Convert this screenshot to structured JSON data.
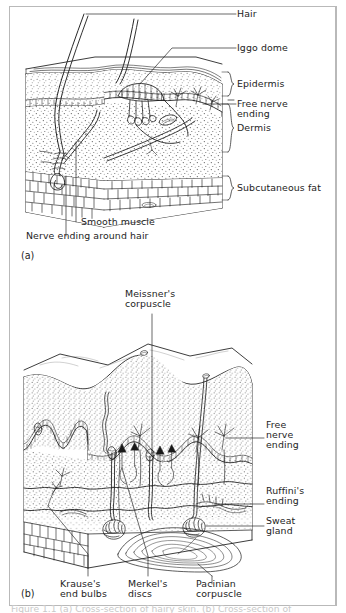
{
  "figure": {
    "caption": "Figure 1.1 (a) Cross-section of hairy skin. (b) Cross-section of",
    "panels": [
      {
        "id": "(a)",
        "title": "hairy skin cross-section"
      },
      {
        "id": "(b)",
        "title": "glabrous skin cross-section"
      }
    ]
  },
  "panel_a": {
    "id": "(a)",
    "labels": {
      "hair": "Hair",
      "iggo_dome": "Iggo dome",
      "epidermis": "Epidermis",
      "free_nerve_ending_l1": "Free nerve",
      "free_nerve_ending_l2": "ending",
      "dermis": "Dermis",
      "subcutaneous_fat": "Subcutaneous fat",
      "smooth_muscle": "Smooth muscle",
      "nerve_ending_around_hair": "Nerve ending around hair"
    }
  },
  "panel_b": {
    "id": "(b)",
    "labels": {
      "meissner_l1": "Meissner's",
      "meissner_l2": "corpuscle",
      "free_nerve_l1": "Free",
      "free_nerve_l2": "nerve",
      "free_nerve_l3": "ending",
      "ruffini_l1": "Ruffini's",
      "ruffini_l2": "ending",
      "sweat_l1": "Sweat",
      "sweat_l2": "gland",
      "krause_l1": "Krause's",
      "krause_l2": "end bulbs",
      "merkel_l1": "Merkel's",
      "merkel_l2": "discs",
      "pacinian_l1": "Pacinian",
      "pacinian_l2": "corpuscle"
    }
  },
  "colors": {
    "ink": "#1a1a1a",
    "paper": "#ffffff",
    "frame": "#b9b9b9",
    "stipple": "#555555"
  }
}
